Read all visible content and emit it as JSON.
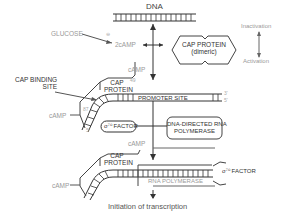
{
  "diagram": {
    "title": "DNA",
    "glucose_label": "GLUCOSE",
    "glucose_effect": "⊖",
    "two_camp_label": "2cAMP",
    "cap_protein_dimeric": {
      "line1": "CAP PROTEIN",
      "line2": "(dimeric)"
    },
    "legend": {
      "top": "Inactivation",
      "bottom": "Activation"
    },
    "camp_top": "cAMP",
    "cap_binding_site": {
      "line1": "CAP BINDING",
      "line2": "SITE"
    },
    "cap_protein_1": {
      "line1": "CAP",
      "line2": "PROTEIN"
    },
    "num_49": "49",
    "num_87": "87",
    "camp_left_1": "cAMP",
    "promoter_site": "PROMOTER SITE",
    "end_3": "3'",
    "end_5": "5'",
    "end_5_left": "5'",
    "sigma_factor_1": "σ⁷⁰ FACTOR",
    "rna_polymerase_box": {
      "line1": "DNA-DIRECTED RNA",
      "line2": "POLYMERASE"
    },
    "camp_mid": "cAMP",
    "cap_protein_2": {
      "line1": "CAP",
      "line2": "PROTEIN"
    },
    "camp_left_2": "cAMP",
    "sigma_factor_2": "σ⁷⁰ FACTOR",
    "rna_polymerase": "RNA POLYMERASE",
    "caption": "Initiation of transcription"
  }
}
